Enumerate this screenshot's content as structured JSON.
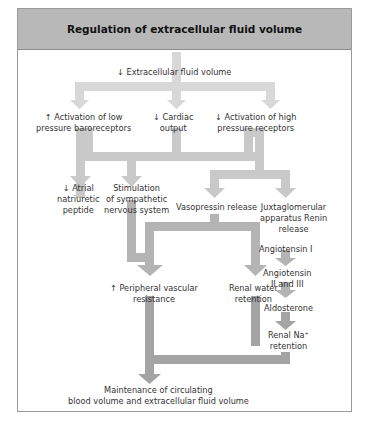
{
  "title": "Regulation of extracellular fluid volume",
  "nodes": {
    "ecf": "↓ Extracellular fluid volume",
    "low_baro_1": "↑ Activation of low",
    "low_baro_2": "pressure baroreceptors",
    "cardiac_1": "↓ Cardiac",
    "cardiac_2": "output",
    "high_rec_1": "↓ Activation of high",
    "high_rec_2": "pressure receptors",
    "anp_1": "↓ Atrial",
    "anp_2": "natriuretic",
    "anp_3": "peptide",
    "sns_1": "Stimulation",
    "sns_2": "of sympathetic",
    "sns_3": "nervous system",
    "vaso": "Vasopressin release",
    "jga_1": "Juxtaglomerular",
    "jga_2": "apparatus Renin",
    "jga_3": "release",
    "ang1": "Angiotensin I",
    "ang2_1": "Angiotensin",
    "ang2_2": "II and III",
    "aldo": "Aldosterone",
    "na_1": "Renal Na⁺",
    "na_2": "retention",
    "pvr_1": "↑ Peripheral vascular",
    "pvr_2": "resistance",
    "water_1": "Renal water",
    "water_2": "retention",
    "out_1": "Maintenance of circulating",
    "out_2": "blood volume and extracellular fluid volume"
  },
  "colors": {
    "header_bg": "#b8b8b8",
    "arrow_light": "#d6d6d6",
    "arrow_mid": "#bdbdbd",
    "arrow_dark": "#a3a3a3",
    "border": "#9a9a9a"
  }
}
